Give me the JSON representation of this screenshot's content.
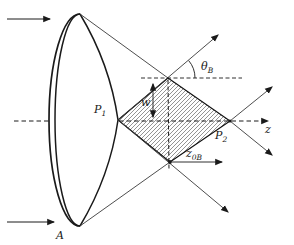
{
  "figure": {
    "type": "optics-axicon-bessel-zone-diagram",
    "labels": {
      "lens": "A",
      "p1_main": "P",
      "p1_sub": "1",
      "p2_main": "P",
      "p2_sub": "2",
      "theta_main": "θ",
      "theta_sub": "B",
      "waist": "w",
      "z0b_main": "z",
      "z0b_sub": "0B",
      "z_axis": "z"
    },
    "colors": {
      "background": "#ffffff",
      "stroke": "#1a1a1a",
      "ray": "#3a3a3a",
      "hatch": "#3a3a3a"
    }
  }
}
